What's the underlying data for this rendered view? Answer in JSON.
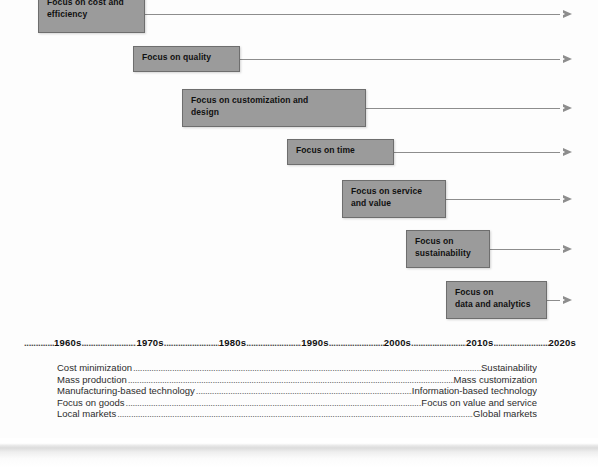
{
  "diagram": {
    "colors": {
      "box_fill": "#9b9b9b",
      "box_border": "#6e6e6e",
      "box_text": "#101010",
      "arrow": "#8d8d8d",
      "axis_text": "#111111",
      "leader": "#5d5d5d",
      "background": "#fdfdfd"
    },
    "phases": [
      {
        "label": "Focus on cost and efficiency",
        "line1": "Focus on cost and",
        "line2": "efficiency",
        "box": {
          "left": 38,
          "top": -9,
          "width": 107,
          "height": 42
        },
        "line": {
          "y": 14,
          "from": 145,
          "to": 563
        }
      },
      {
        "label": "Focus on quality",
        "line1": "Focus on quality",
        "line2": "",
        "box": {
          "left": 133,
          "top": 46,
          "width": 107,
          "height": 26
        },
        "line": {
          "y": 59,
          "from": 240,
          "to": 563
        }
      },
      {
        "label": "Focus on customization and design",
        "line1": "Focus on customization and",
        "line2": "design",
        "box": {
          "left": 182,
          "top": 89,
          "width": 184,
          "height": 38
        },
        "line": {
          "y": 108,
          "from": 366,
          "to": 563
        }
      },
      {
        "label": "Focus on time",
        "line1": "Focus on time",
        "line2": "",
        "box": {
          "left": 287,
          "top": 139,
          "width": 107,
          "height": 26
        },
        "line": {
          "y": 152,
          "from": 394,
          "to": 563
        }
      },
      {
        "label": "Focus on service and value",
        "line1": "Focus on service",
        "line2": "and value",
        "box": {
          "left": 342,
          "top": 180,
          "width": 104,
          "height": 38
        },
        "line": {
          "y": 199,
          "from": 446,
          "to": 563
        }
      },
      {
        "label": "Focus on sustainability",
        "line1": "Focus on",
        "line2": "sustainability",
        "box": {
          "left": 406,
          "top": 230,
          "width": 84,
          "height": 38
        },
        "line": {
          "y": 249,
          "from": 490,
          "to": 563
        }
      },
      {
        "label": "Focus on data and analytics",
        "line1": "Focus on",
        "line2": "data and analytics",
        "box": {
          "left": 446,
          "top": 281,
          "width": 101,
          "height": 38
        },
        "line": {
          "y": 300,
          "from": 547,
          "to": 563
        }
      }
    ],
    "decades": [
      "1960s",
      "1970s",
      "1980s",
      "1990s",
      "2000s",
      "2010s",
      "2020s"
    ],
    "leader_dots": "..........................................................................................................",
    "shifts": [
      {
        "from": "Cost minimization",
        "to": "Sustainability"
      },
      {
        "from": "Mass production",
        "to": "Mass customization"
      },
      {
        "from": "Manufacturing-based technology",
        "to": "Information-based technology"
      },
      {
        "from": "Focus on goods",
        "to": "Focus on value and service"
      },
      {
        "from": "Local markets",
        "to": "Global markets"
      }
    ]
  }
}
